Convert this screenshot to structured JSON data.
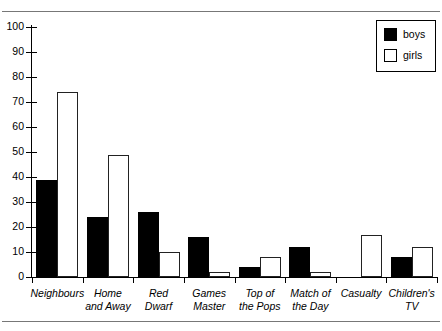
{
  "chart_data": {
    "type": "bar",
    "title": "",
    "subtitle": "",
    "xlabel": "",
    "ylabel": "",
    "ylim": [
      0,
      100
    ],
    "yticks": [
      0,
      10,
      20,
      30,
      40,
      50,
      60,
      70,
      80,
      90,
      100
    ],
    "grid": false,
    "legend_position": "top-right",
    "categories": [
      "Neighbours",
      "Home\nand Away",
      "Red\nDwarf",
      "Games\nMaster",
      "Top of\nthe Pops",
      "Match of\nthe Day",
      "Casualty",
      "Children's\nTV"
    ],
    "series": [
      {
        "name": "boys",
        "color": "#000000",
        "values": [
          39,
          24,
          26,
          16,
          4,
          12,
          0,
          8
        ]
      },
      {
        "name": "girls",
        "color": "#ffffff",
        "values": [
          74,
          49,
          10,
          2,
          8,
          2,
          17,
          12
        ]
      }
    ]
  },
  "legend": {
    "entries": [
      {
        "label": "boys",
        "swatch": "filled-black-square"
      },
      {
        "label": "girls",
        "swatch": "outlined-white-square"
      }
    ]
  }
}
